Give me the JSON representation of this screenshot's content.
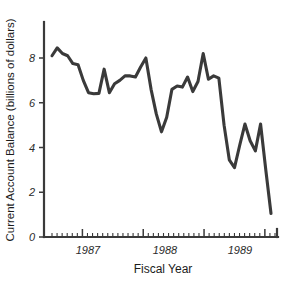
{
  "chart_data": {
    "type": "line",
    "title": "",
    "xlabel": "Fiscal Year",
    "ylabel": "Current Account Balance (billions of dollars)",
    "xlim": [
      0,
      44
    ],
    "ylim": [
      0,
      9
    ],
    "grid": false,
    "legend": null,
    "y_ticks": [
      0,
      2,
      4,
      6,
      8
    ],
    "y_tick_labels": [
      "0",
      "2",
      "4",
      "6",
      "8"
    ],
    "x_tick_labels": [
      "1987",
      "1988",
      "1989"
    ],
    "x_tick_positions": [
      6,
      18,
      30
    ],
    "x_minor_tick_count": 44,
    "series": [
      {
        "name": "Current Account Balance",
        "x": [
          0,
          1,
          2,
          3,
          4,
          5,
          6,
          7,
          8,
          9,
          10,
          11,
          12,
          13,
          14,
          15,
          16,
          17,
          18,
          19,
          20,
          21,
          22,
          23,
          24,
          25,
          26,
          27,
          28,
          29,
          30,
          31,
          32,
          33,
          34,
          35,
          36,
          37,
          38,
          39,
          40,
          41,
          42
        ],
        "values": [
          8.1,
          8.45,
          8.2,
          8.1,
          7.75,
          7.7,
          7.0,
          6.45,
          6.4,
          6.42,
          7.5,
          6.45,
          6.85,
          7.0,
          7.2,
          7.2,
          7.15,
          7.6,
          8.0,
          6.6,
          5.5,
          4.7,
          5.35,
          6.6,
          6.75,
          6.7,
          7.15,
          6.5,
          6.95,
          8.2,
          7.05,
          7.2,
          7.1,
          5.0,
          3.45,
          3.1,
          4.1,
          5.05,
          4.3,
          3.85,
          5.05,
          3.0,
          1.05
        ]
      }
    ]
  },
  "axis": {
    "y_label": "Current Account Balance (billions of dollars)",
    "x_label": "Fiscal Year"
  },
  "colors": {
    "line": "#3a3a3a",
    "axis": "#3a3a3a",
    "background": "#ffffff",
    "text": "#1c1c1c"
  }
}
